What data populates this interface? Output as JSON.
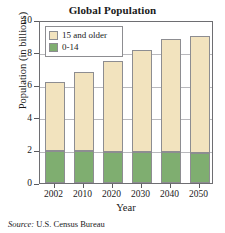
{
  "chart_data": {
    "type": "bar",
    "stacked": true,
    "title": "Global Population",
    "xlabel": "Year",
    "ylabel": "Population (in billions)",
    "categories": [
      "2002",
      "2010",
      "2020",
      "2030",
      "2040",
      "2050"
    ],
    "series": [
      {
        "name": "0-14",
        "color": "#7FAE70",
        "values": [
          1.95,
          1.95,
          1.92,
          1.9,
          1.88,
          1.85
        ]
      },
      {
        "name": "15 and older",
        "color": "#F2E3BE",
        "values": [
          4.25,
          4.85,
          5.58,
          6.25,
          6.95,
          7.2
        ]
      }
    ],
    "totals": [
      6.2,
      6.8,
      7.5,
      8.15,
      8.83,
      9.05
    ],
    "ylim": [
      0,
      10
    ],
    "yticks": [
      0,
      2,
      4,
      6,
      8,
      10
    ],
    "ytick_labels": [
      "0",
      "2",
      "4",
      "6",
      "8",
      "10"
    ],
    "grid": true,
    "legend_position": "top-left",
    "legend_entries": [
      {
        "label": "15 and older",
        "color": "#F2E3BE"
      },
      {
        "label": "0-14",
        "color": "#7FAE70"
      }
    ]
  },
  "source": {
    "label": "Source:",
    "text": "U.S. Census Bureau"
  }
}
